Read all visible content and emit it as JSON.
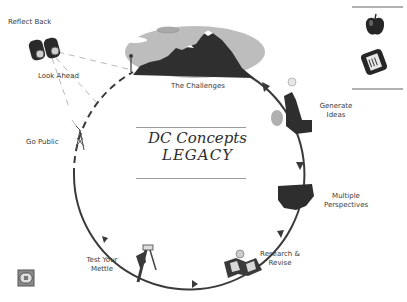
{
  "title": {
    "line1": "DC Concepts",
    "line2": "LEGACY"
  },
  "stages": [
    {
      "id": "reflect-back",
      "label": "Reflect Back",
      "icon": "binoculars-icon"
    },
    {
      "id": "look-ahead",
      "label": "Look Ahead",
      "icon": "binoculars-icon"
    },
    {
      "id": "the-challenges",
      "label": "The Challenges",
      "icon": "mountains-icon"
    },
    {
      "id": "generate-ideas",
      "label_lines": [
        "Generate",
        "Ideas"
      ],
      "icon": "thinker-lightbulb-icon"
    },
    {
      "id": "multiple-perspectives",
      "label_lines": [
        "Multiple",
        "Perspectives"
      ],
      "icon": "us-map-icon"
    },
    {
      "id": "research-revise",
      "label_lines": [
        "Research &",
        "Revise"
      ],
      "icon": "open-book-icon"
    },
    {
      "id": "test-your-mettle",
      "label_lines": [
        "Test Your",
        "Mettle"
      ],
      "icon": "tools-icon"
    },
    {
      "id": "go-public",
      "label": "Go Public",
      "icon": "broadcast-tower-icon"
    }
  ],
  "side_panel": {
    "items": [
      {
        "name": "apple-icon"
      },
      {
        "name": "notepad-icon"
      }
    ]
  },
  "corner_button": {
    "name": "stop-sign-icon"
  },
  "colors": {
    "line": "#3a3a3a",
    "ellipse": "#bdbdbd",
    "mountain": "#2f2f2f",
    "text": "#3a3a3a"
  }
}
